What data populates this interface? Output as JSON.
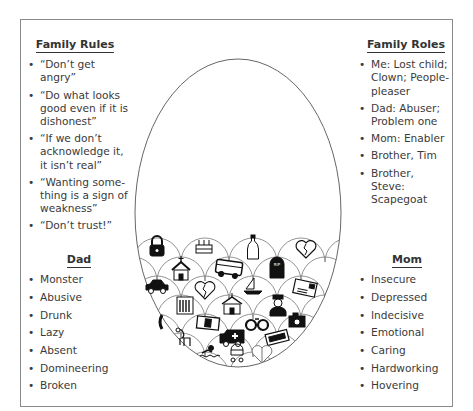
{
  "family_rules": {
    "title": "Family Rules",
    "items": [
      "“Don’t get angry”",
      "“Do what looks good even if it is dishonest”",
      "“If we don’t acknowledge it, it isn’t real”",
      "“Wanting some-thing is a sign of weakness”",
      "“Don’t trust!”"
    ]
  },
  "family_roles": {
    "title": "Family Roles",
    "items": [
      "Me: Lost child; Clown; People-pleaser",
      "Dad: Abuser; Problem one",
      "Mom: Enabler",
      "Brother, Tim",
      "Brother, Steve: Scapegoat"
    ]
  },
  "dad": {
    "title": "Dad",
    "items": [
      "Monster",
      "Abusive",
      "Drunk",
      "Lazy",
      "Absent",
      "Domineering",
      "Broken"
    ]
  },
  "mom": {
    "title": "Mom",
    "items": [
      "Insecure",
      "Depressed",
      "Indecisive",
      "Emotional",
      "Caring",
      "Hardworking",
      "Hovering"
    ]
  },
  "egg": {
    "icons": [
      "padlock-icon",
      "birthday-cake-icon",
      "champagne-bottle-icon",
      "broken-heart-icon",
      "church-icon",
      "bus-icon",
      "gravestone-icon",
      "car-icon",
      "broken-heart-icon",
      "sailboat-icon",
      "letter-icon",
      "office-building-icon",
      "schoolhouse-icon",
      "police-officer-icon",
      "telephone-icon",
      "money-icon",
      "handcuffs-icon",
      "camera-icon",
      "dog-icon",
      "ambulance-icon",
      "tickets-icon",
      "swimmer-icon",
      "baby-stroller-icon",
      "mended-heart-icon"
    ],
    "gravestone_text": "RIP"
  }
}
